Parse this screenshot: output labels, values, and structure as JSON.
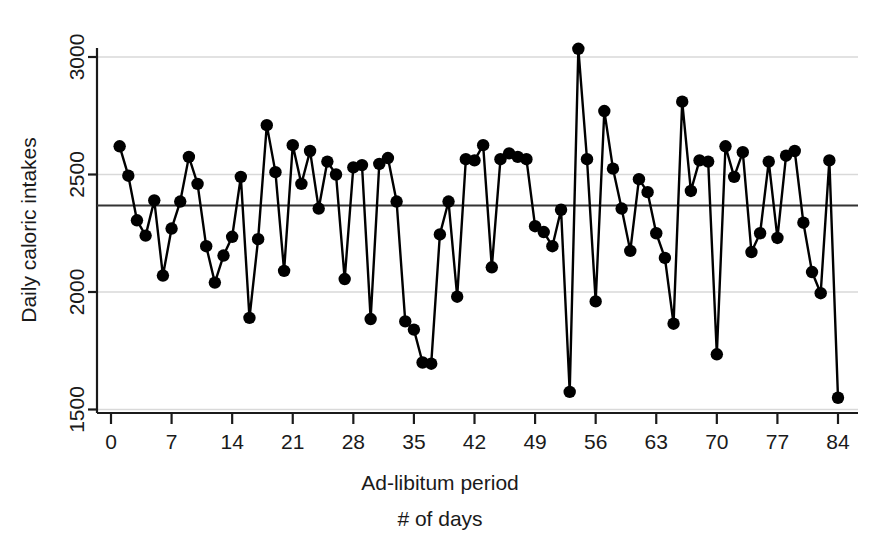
{
  "chart_data": {
    "type": "line",
    "title": "",
    "subtitle": "",
    "xlabel": "Ad-libitum period",
    "xlabel_line2": "# of days",
    "ylabel": "Daily caloric intakes",
    "xlim": [
      0,
      86
    ],
    "ylim": [
      1450,
      3090
    ],
    "xticks": [
      0,
      7,
      14,
      21,
      28,
      35,
      42,
      49,
      56,
      63,
      70,
      77,
      84
    ],
    "yticks": [
      1500,
      2000,
      2500,
      3000
    ],
    "gridlines_y": [
      1500,
      2000,
      2500,
      3000
    ],
    "grid": true,
    "legend": "none",
    "marker": "filled-circle",
    "marker_color": "#000000",
    "line_color": "#000000",
    "grid_color": "#d9d9d9",
    "axis_color": "#1a1a1a",
    "mean_line": {
      "value": 2368,
      "color": "#333333",
      "label": ""
    },
    "x": [
      1,
      2,
      3,
      4,
      5,
      6,
      7,
      8,
      9,
      10,
      11,
      12,
      13,
      14,
      15,
      16,
      17,
      18,
      19,
      20,
      21,
      22,
      23,
      24,
      25,
      26,
      27,
      28,
      29,
      30,
      31,
      32,
      33,
      34,
      35,
      36,
      37,
      38,
      39,
      40,
      41,
      42,
      43,
      44,
      45,
      46,
      47,
      48,
      49,
      50,
      51,
      52,
      53,
      54,
      55,
      56,
      57,
      58,
      59,
      60,
      61,
      62,
      63,
      64,
      65,
      66,
      67,
      68,
      69,
      70,
      71,
      72,
      73,
      74,
      75,
      76,
      77,
      78,
      79,
      80,
      81,
      82,
      83,
      84
    ],
    "values": [
      2620,
      2495,
      2305,
      2240,
      2390,
      2070,
      2270,
      2385,
      2575,
      2460,
      2195,
      2040,
      2155,
      2235,
      2490,
      1890,
      2225,
      2710,
      2510,
      2090,
      2625,
      2460,
      2600,
      2355,
      2555,
      2500,
      2055,
      2530,
      2540,
      1885,
      2545,
      2570,
      2385,
      1875,
      1840,
      1700,
      1695,
      2245,
      2385,
      1980,
      2565,
      2560,
      2625,
      2105,
      2565,
      2590,
      2575,
      2565,
      2280,
      2255,
      2195,
      2350,
      1575,
      3035,
      2565,
      1960,
      2770,
      2525,
      2355,
      2175,
      2480,
      2425,
      2250,
      2145,
      1865,
      2810,
      2430,
      2560,
      2555,
      1735,
      2620,
      2490,
      2595,
      2170,
      2250,
      2555,
      2230,
      2580,
      2600,
      2295,
      2085,
      1995,
      2560,
      1550
    ]
  },
  "figure": {
    "background": "#ffffff",
    "width": 883,
    "height": 554
  }
}
